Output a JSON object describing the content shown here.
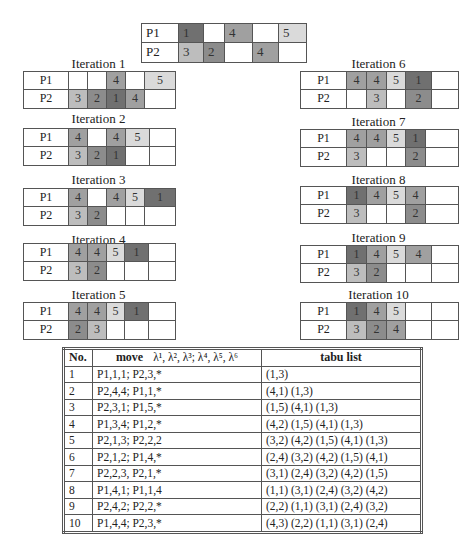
{
  "colors": {
    "job1": "#707070",
    "job2": "#8c8c8c",
    "job3": "#bdbdbd",
    "job4": "#a0a0a0",
    "job5": "#dadada",
    "border": "#555555"
  },
  "initial_schedule": {
    "rows": [
      {
        "label": "P1",
        "cells": [
          {
            "v": "1",
            "s": 1,
            "w": 25
          },
          {
            "v": "",
            "s": 0,
            "w": 21
          },
          {
            "v": "4",
            "s": 4,
            "w": 28
          },
          {
            "v": "",
            "s": 0,
            "w": 26
          },
          {
            "v": "5",
            "s": 5,
            "w": 27
          }
        ]
      },
      {
        "label": "P2",
        "cells": [
          {
            "v": "3",
            "s": 3,
            "w": 25
          },
          {
            "v": "2",
            "s": 2,
            "w": 21
          },
          {
            "v": "",
            "s": 0,
            "w": 28
          },
          {
            "v": "4",
            "s": 4,
            "w": 26
          },
          {
            "v": "",
            "s": 0,
            "w": 27
          }
        ]
      }
    ]
  },
  "iterations": [
    {
      "title": "Iteration 1",
      "rows": [
        {
          "label": "P1",
          "cells": [
            {
              "v": "",
              "s": 0,
              "w": 19
            },
            {
              "v": "",
              "s": 0,
              "w": 19
            },
            {
              "v": "4",
              "s": 4,
              "w": 19
            },
            {
              "v": "",
              "s": 0,
              "w": 19
            },
            {
              "v": "5",
              "s": 5,
              "w": 30
            }
          ]
        },
        {
          "label": "P2",
          "cells": [
            {
              "v": "3",
              "s": 3,
              "w": 19
            },
            {
              "v": "2",
              "s": 2,
              "w": 19
            },
            {
              "v": "1",
              "s": 1,
              "w": 19
            },
            {
              "v": "4",
              "s": 4,
              "w": 19
            },
            {
              "v": "",
              "s": 0,
              "w": 30
            }
          ]
        }
      ]
    },
    {
      "title": "Iteration 2",
      "rows": [
        {
          "label": "P1",
          "cells": [
            {
              "v": "4",
              "s": 4,
              "w": 19
            },
            {
              "v": "",
              "s": 0,
              "w": 19
            },
            {
              "v": "4",
              "s": 4,
              "w": 19
            },
            {
              "v": "5",
              "s": 5,
              "w": 24
            },
            {
              "v": "",
              "s": 0,
              "w": 25
            }
          ]
        },
        {
          "label": "P2",
          "cells": [
            {
              "v": "3",
              "s": 3,
              "w": 19
            },
            {
              "v": "2",
              "s": 2,
              "w": 19
            },
            {
              "v": "1",
              "s": 1,
              "w": 19
            },
            {
              "v": "",
              "s": 0,
              "w": 24
            },
            {
              "v": "",
              "s": 0,
              "w": 25
            }
          ]
        }
      ]
    },
    {
      "title": "Iteration 3",
      "rows": [
        {
          "label": "P1",
          "cells": [
            {
              "v": "4",
              "s": 4,
              "w": 19
            },
            {
              "v": "",
              "s": 0,
              "w": 19
            },
            {
              "v": "4",
              "s": 4,
              "w": 19
            },
            {
              "v": "5",
              "s": 5,
              "w": 19
            },
            {
              "v": "1",
              "s": 1,
              "w": 30
            }
          ]
        },
        {
          "label": "P2",
          "cells": [
            {
              "v": "3",
              "s": 3,
              "w": 19
            },
            {
              "v": "2",
              "s": 2,
              "w": 19
            },
            {
              "v": "",
              "s": 0,
              "w": 19
            },
            {
              "v": "",
              "s": 0,
              "w": 19
            },
            {
              "v": "",
              "s": 0,
              "w": 30
            }
          ]
        }
      ]
    },
    {
      "title": "Iteration 4",
      "rows": [
        {
          "label": "P1",
          "cells": [
            {
              "v": "4",
              "s": 4,
              "w": 19
            },
            {
              "v": "4",
              "s": 4,
              "w": 19
            },
            {
              "v": "5",
              "s": 5,
              "w": 18
            },
            {
              "v": "1",
              "s": 1,
              "w": 24
            },
            {
              "v": "",
              "s": 0,
              "w": 26
            }
          ]
        },
        {
          "label": "P2",
          "cells": [
            {
              "v": "3",
              "s": 3,
              "w": 19
            },
            {
              "v": "2",
              "s": 2,
              "w": 19
            },
            {
              "v": "",
              "s": 0,
              "w": 18
            },
            {
              "v": "",
              "s": 0,
              "w": 24
            },
            {
              "v": "",
              "s": 0,
              "w": 26
            }
          ]
        }
      ]
    },
    {
      "title": "Iteration 5",
      "rows": [
        {
          "label": "P1",
          "cells": [
            {
              "v": "4",
              "s": 4,
              "w": 19
            },
            {
              "v": "4",
              "s": 4,
              "w": 19
            },
            {
              "v": "5",
              "s": 5,
              "w": 18
            },
            {
              "v": "1",
              "s": 1,
              "w": 24
            },
            {
              "v": "",
              "s": 0,
              "w": 26
            }
          ]
        },
        {
          "label": "P2",
          "cells": [
            {
              "v": "2",
              "s": 2,
              "w": 19
            },
            {
              "v": "3",
              "s": 3,
              "w": 19
            },
            {
              "v": "",
              "s": 0,
              "w": 18
            },
            {
              "v": "",
              "s": 0,
              "w": 24
            },
            {
              "v": "",
              "s": 0,
              "w": 26
            }
          ]
        }
      ]
    },
    {
      "title": "Iteration 6",
      "rows": [
        {
          "label": "P1",
          "cells": [
            {
              "v": "4",
              "s": 4,
              "w": 20
            },
            {
              "v": "4",
              "s": 4,
              "w": 20
            },
            {
              "v": "5",
              "s": 5,
              "w": 19
            },
            {
              "v": "1",
              "s": 1,
              "w": 26
            },
            {
              "v": "",
              "s": 0,
              "w": 26
            }
          ]
        },
        {
          "label": "P2",
          "cells": [
            {
              "v": "",
              "s": 0,
              "w": 20
            },
            {
              "v": "3",
              "s": 3,
              "w": 20
            },
            {
              "v": "",
              "s": 0,
              "w": 19
            },
            {
              "v": "2",
              "s": 2,
              "w": 26
            },
            {
              "v": "",
              "s": 0,
              "w": 26
            }
          ]
        }
      ]
    },
    {
      "title": "Iteration 7",
      "rows": [
        {
          "label": "P1",
          "cells": [
            {
              "v": "4",
              "s": 4,
              "w": 20
            },
            {
              "v": "4",
              "s": 4,
              "w": 20
            },
            {
              "v": "5",
              "s": 5,
              "w": 19
            },
            {
              "v": "1",
              "s": 1,
              "w": 20
            },
            {
              "v": "",
              "s": 0,
              "w": 32
            }
          ]
        },
        {
          "label": "P2",
          "cells": [
            {
              "v": "3",
              "s": 3,
              "w": 20
            },
            {
              "v": "",
              "s": 0,
              "w": 20
            },
            {
              "v": "",
              "s": 0,
              "w": 19
            },
            {
              "v": "2",
              "s": 2,
              "w": 20
            },
            {
              "v": "",
              "s": 0,
              "w": 32
            }
          ]
        }
      ]
    },
    {
      "title": "Iteration 8",
      "rows": [
        {
          "label": "P1",
          "cells": [
            {
              "v": "1",
              "s": 1,
              "w": 20
            },
            {
              "v": "4",
              "s": 4,
              "w": 20
            },
            {
              "v": "5",
              "s": 5,
              "w": 19
            },
            {
              "v": "4",
              "s": 4,
              "w": 20
            },
            {
              "v": "",
              "s": 0,
              "w": 32
            }
          ]
        },
        {
          "label": "P2",
          "cells": [
            {
              "v": "3",
              "s": 3,
              "w": 20
            },
            {
              "v": "",
              "s": 0,
              "w": 20
            },
            {
              "v": "",
              "s": 0,
              "w": 19
            },
            {
              "v": "2",
              "s": 2,
              "w": 20
            },
            {
              "v": "",
              "s": 0,
              "w": 32
            }
          ]
        }
      ]
    },
    {
      "title": "Iteration 9",
      "rows": [
        {
          "label": "P1",
          "cells": [
            {
              "v": "1",
              "s": 1,
              "w": 20
            },
            {
              "v": "4",
              "s": 4,
              "w": 20
            },
            {
              "v": "5",
              "s": 5,
              "w": 19
            },
            {
              "v": "4",
              "s": 4,
              "w": 26
            },
            {
              "v": "",
              "s": 0,
              "w": 26
            }
          ]
        },
        {
          "label": "P2",
          "cells": [
            {
              "v": "3",
              "s": 3,
              "w": 20
            },
            {
              "v": "2",
              "s": 2,
              "w": 20
            },
            {
              "v": "",
              "s": 0,
              "w": 19
            },
            {
              "v": "",
              "s": 0,
              "w": 26
            },
            {
              "v": "",
              "s": 0,
              "w": 26
            }
          ]
        }
      ]
    },
    {
      "title": "Iteration 10",
      "rows": [
        {
          "label": "P1",
          "cells": [
            {
              "v": "1",
              "s": 1,
              "w": 20
            },
            {
              "v": "4",
              "s": 4,
              "w": 20
            },
            {
              "v": "5",
              "s": 5,
              "w": 19
            },
            {
              "v": "",
              "s": 0,
              "w": 26
            },
            {
              "v": "",
              "s": 0,
              "w": 26
            }
          ]
        },
        {
          "label": "P2",
          "cells": [
            {
              "v": "3",
              "s": 3,
              "w": 20
            },
            {
              "v": "2",
              "s": 2,
              "w": 20
            },
            {
              "v": "4",
              "s": 4,
              "w": 19
            },
            {
              "v": "",
              "s": 0,
              "w": 26
            },
            {
              "v": "",
              "s": 0,
              "w": 26
            }
          ]
        }
      ]
    }
  ],
  "table": {
    "headers": {
      "no": "No.",
      "move": "move",
      "lambda": "λ¹, λ², λ³; λ⁴, λ⁵, λ⁶",
      "tabu": "tabu list"
    },
    "rows": [
      {
        "no": "1",
        "move": "P1,1,1; P2,3,*",
        "tabu": "(1,3)"
      },
      {
        "no": "2",
        "move": "P2,4,4; P1,1,*",
        "tabu": "(4,1) (1,3)"
      },
      {
        "no": "3",
        "move": "P2,3,1; P1,5,*",
        "tabu": "(1,5) (4,1) (1,3)"
      },
      {
        "no": "4",
        "move": "P1,3,4; P1,2,*",
        "tabu": "(4,2) (1,5) (4,1) (1,3)"
      },
      {
        "no": "5",
        "move": "P2,1,3; P2,2,2",
        "tabu": "(3,2) (4,2) (1,5) (4,1) (1,3)"
      },
      {
        "no": "6",
        "move": "P2,1,2; P1,4,*",
        "tabu": "(2,4) (3,2) (4,2) (1,5) (4,1)"
      },
      {
        "no": "7",
        "move": "P2,2,3, P2,1,*",
        "tabu": "(3,1) (2,4) (3,2) (4,2) (1,5)"
      },
      {
        "no": "8",
        "move": "P1,4,1; P1,1,4",
        "tabu": "(1,1) (3,1) (2,4) (3,2) (4,2)"
      },
      {
        "no": "9",
        "move": "P2,4,2; P2,2,*",
        "tabu": "(2,2) (1,1) (3,1) (2,4) (3,2)"
      },
      {
        "no": "10",
        "move": "P1,4,4; P2,3,*",
        "tabu": "(4,3) (2,2) (1,1) (3,1) (2,4)"
      }
    ]
  }
}
